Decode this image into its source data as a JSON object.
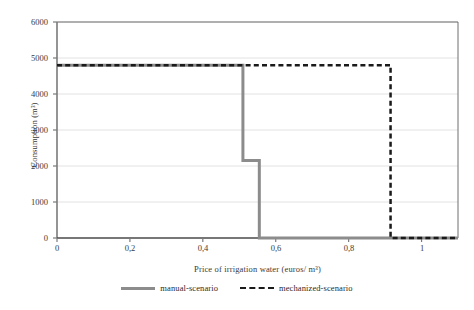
{
  "chart_data": {
    "type": "line",
    "title": "",
    "xlabel": "Price of irrigation water (euros/ m³)",
    "ylabel": "Consumption (m³)",
    "xlim": [
      0,
      1.1
    ],
    "ylim": [
      0,
      6000
    ],
    "grid": true,
    "grid_axis": "y",
    "legend_position": "bottom",
    "x_tick_labels": [
      "0",
      "0,2",
      "0,4",
      "0,6",
      "0,8",
      "1"
    ],
    "x_tick_values": [
      0,
      0.2,
      0.4,
      0.6,
      0.8,
      1
    ],
    "y_tick_labels": [
      "0",
      "1000",
      "2000",
      "3000",
      "4000",
      "5000",
      "6000"
    ],
    "y_tick_values": [
      0,
      1000,
      2000,
      3000,
      4000,
      5000,
      6000
    ],
    "series": [
      {
        "name": "manual-scenario",
        "style": "solid",
        "color": "#8c8c8c",
        "width": 3,
        "x": [
          0,
          0.51,
          0.51,
          0.555,
          0.555,
          1.1
        ],
        "values": [
          4800,
          4800,
          2150,
          2150,
          0,
          0
        ]
      },
      {
        "name": "mechanized-scenario",
        "style": "dashed",
        "color": "#1a1a1a",
        "width": 2.5,
        "x": [
          0,
          0.915,
          0.915,
          1.1
        ],
        "values": [
          4800,
          4800,
          0,
          0
        ]
      }
    ]
  },
  "axes": {
    "y_title": "Consumption (m³)",
    "x_title": "Price of irrigation water (euros/ m³)",
    "y_ticks": [
      "6000",
      "5000",
      "4000",
      "3000",
      "2000",
      "1000",
      "0"
    ],
    "x_ticks": [
      "0",
      "0,2",
      "0,4",
      "0,6",
      "0,8",
      "1"
    ]
  },
  "legend": {
    "items": [
      {
        "label": "manual-scenario",
        "style": "solid",
        "color": "#8c8c8c"
      },
      {
        "label": "mechanized-scenario",
        "style": "dashed",
        "color": "#1a1a1a"
      }
    ]
  },
  "colors": {
    "manual": "#8c8c8c",
    "mechanized": "#1a1a1a",
    "gridline": "#e2e2e2",
    "axis": "#7a7a7a",
    "frame": "#6f6f6f",
    "background": "#ffffff"
  }
}
